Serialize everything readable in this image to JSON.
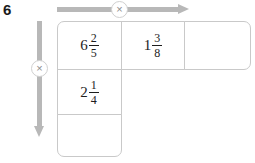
{
  "question": {
    "number": "6"
  },
  "arrows": {
    "horizontal": {
      "operator_symbol": "×",
      "direction": "right",
      "color": "#b8b8b8"
    },
    "vertical": {
      "operator_symbol": "×",
      "direction": "down",
      "color": "#b8b8b8"
    }
  },
  "grid": {
    "border_color": "#c9c9c9",
    "rows": 3,
    "columns": 3,
    "cells": [
      {
        "id": "r1c1",
        "whole": "6",
        "numerator": "2",
        "denominator": "5",
        "empty": false
      },
      {
        "id": "r1c2",
        "whole": "1",
        "numerator": "3",
        "denominator": "8",
        "empty": false
      },
      {
        "id": "r1c3",
        "whole": "",
        "numerator": "",
        "denominator": "",
        "empty": true
      },
      {
        "id": "r2c1",
        "whole": "2",
        "numerator": "1",
        "denominator": "4",
        "empty": false
      },
      {
        "id": "r3c1",
        "whole": "",
        "numerator": "",
        "denominator": "",
        "empty": true
      }
    ]
  }
}
